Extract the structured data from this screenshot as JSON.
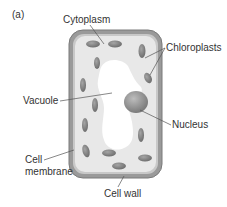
{
  "figure": {
    "panel_label": "(a)"
  },
  "labels": {
    "cytoplasm": "Cytoplasm",
    "chloroplasts": "Chloroplasts",
    "vacuole": "Vacuole",
    "nucleus": "Nucleus",
    "cell_membrane_line1": "Cell",
    "cell_membrane_line2": "membrane",
    "cell_wall": "Cell wall"
  },
  "colors": {
    "cell_wall": "#8a8a8a",
    "cell_membrane": "#b5b5b5",
    "cytoplasm": "#e6e6e6",
    "vacuole": "#ffffff",
    "chloroplast": "#7d7d7d",
    "nucleus": "#9a9a9a",
    "leader_line": "#555555",
    "text": "#333333"
  }
}
